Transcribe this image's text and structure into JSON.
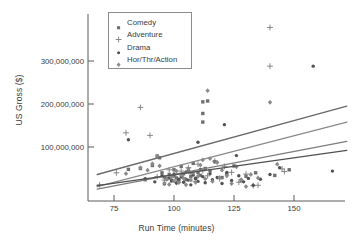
{
  "chart_data": {
    "type": "scatter",
    "title": "",
    "xlabel": "Run Time (minutes)",
    "ylabel": "US Gross ($)",
    "xlim": [
      67,
      175
    ],
    "ylim": [
      -12000000,
      395000000
    ],
    "xticks": [
      75,
      100,
      125,
      150
    ],
    "xtick_labels": [
      "75",
      "100",
      "125",
      "150"
    ],
    "yticks": [
      100000000,
      200000000,
      300000000
    ],
    "ytick_labels": [
      "100,000,000",
      "200,000,000",
      "300,000,000"
    ],
    "grid": false,
    "legend_position": "top-left-inside",
    "series": [
      {
        "name": "Comedy",
        "marker": "square",
        "color": "#6f6f6f",
        "points": [
          [
            81,
            48000000
          ],
          [
            86,
            50000000
          ],
          [
            88,
            24000000
          ],
          [
            91,
            57000000
          ],
          [
            93,
            79000000
          ],
          [
            94,
            75000000
          ],
          [
            95,
            40000000
          ],
          [
            96,
            30000000
          ],
          [
            97,
            26000000
          ],
          [
            98,
            36000000
          ],
          [
            99,
            22000000
          ],
          [
            100,
            33000000
          ],
          [
            100,
            47000000
          ],
          [
            101,
            28000000
          ],
          [
            102,
            20000000
          ],
          [
            103,
            55000000
          ],
          [
            104,
            38000000
          ],
          [
            105,
            24000000
          ],
          [
            106,
            44000000
          ],
          [
            107,
            31000000
          ],
          [
            108,
            62000000
          ],
          [
            109,
            27000000
          ],
          [
            110,
            41000000
          ],
          [
            111,
            34000000
          ],
          [
            112,
            205000000
          ],
          [
            112,
            178000000
          ],
          [
            112,
            158000000
          ],
          [
            113,
            50000000
          ],
          [
            114,
            207000000
          ],
          [
            115,
            45000000
          ],
          [
            117,
            66000000
          ],
          [
            120,
            29000000
          ],
          [
            122,
            37000000
          ],
          [
            125,
            56000000
          ],
          [
            128,
            22000000
          ],
          [
            130,
            32000000
          ],
          [
            134,
            40000000
          ],
          [
            142,
            34000000
          ],
          [
            148,
            47000000
          ]
        ]
      },
      {
        "name": "Adventure",
        "marker": "plus",
        "color": "#7d7d7d",
        "points": [
          [
            69,
            12000000
          ],
          [
            76,
            40000000
          ],
          [
            80,
            133000000
          ],
          [
            86,
            192000000
          ],
          [
            90,
            127000000
          ],
          [
            93,
            31000000
          ],
          [
            96,
            23000000
          ],
          [
            98,
            47000000
          ],
          [
            100,
            35000000
          ],
          [
            101,
            18000000
          ],
          [
            103,
            44000000
          ],
          [
            104,
            29000000
          ],
          [
            106,
            52000000
          ],
          [
            107,
            38000000
          ],
          [
            109,
            20000000
          ],
          [
            110,
            60000000
          ],
          [
            112,
            45000000
          ],
          [
            114,
            33000000
          ],
          [
            117,
            67000000
          ],
          [
            119,
            26000000
          ],
          [
            121,
            55000000
          ],
          [
            124,
            41000000
          ],
          [
            127,
            18000000
          ],
          [
            130,
            37000000
          ],
          [
            133,
            10000000
          ],
          [
            135,
            11000000
          ],
          [
            140,
            378000000
          ],
          [
            140,
            288000000
          ],
          [
            145,
            49000000
          ],
          [
            146,
            43000000
          ]
        ]
      },
      {
        "name": "Drama",
        "marker": "dot",
        "color": "#515151",
        "points": [
          [
            81,
            117000000
          ],
          [
            88,
            26000000
          ],
          [
            92,
            19000000
          ],
          [
            95,
            33000000
          ],
          [
            96,
            14000000
          ],
          [
            98,
            28000000
          ],
          [
            99,
            21000000
          ],
          [
            100,
            37000000
          ],
          [
            101,
            16000000
          ],
          [
            102,
            25000000
          ],
          [
            103,
            30000000
          ],
          [
            104,
            18000000
          ],
          [
            105,
            42000000
          ],
          [
            106,
            23000000
          ],
          [
            107,
            12000000
          ],
          [
            108,
            35000000
          ],
          [
            109,
            27000000
          ],
          [
            110,
            111000000
          ],
          [
            110,
            20000000
          ],
          [
            111,
            48000000
          ],
          [
            112,
            31000000
          ],
          [
            113,
            17000000
          ],
          [
            115,
            38000000
          ],
          [
            116,
            24000000
          ],
          [
            118,
            29000000
          ],
          [
            120,
            15000000
          ],
          [
            121,
            152000000
          ],
          [
            122,
            41000000
          ],
          [
            124,
            22000000
          ],
          [
            126,
            80000000
          ],
          [
            127,
            33000000
          ],
          [
            129,
            19000000
          ],
          [
            131,
            27000000
          ],
          [
            133,
            11000000
          ],
          [
            136,
            25000000
          ],
          [
            140,
            36000000
          ],
          [
            144,
            52000000
          ],
          [
            158,
            288000000
          ],
          [
            166,
            44000000
          ]
        ]
      },
      {
        "name": "Hor/Thr/Action",
        "marker": "diamond",
        "color": "#8a8a8a",
        "points": [
          [
            80,
            38000000
          ],
          [
            86,
            52000000
          ],
          [
            89,
            46000000
          ],
          [
            91,
            61000000
          ],
          [
            93,
            79000000
          ],
          [
            94,
            56000000
          ],
          [
            96,
            16000000
          ],
          [
            97,
            25000000
          ],
          [
            98,
            13000000
          ],
          [
            99,
            30000000
          ],
          [
            100,
            21000000
          ],
          [
            101,
            44000000
          ],
          [
            102,
            17000000
          ],
          [
            103,
            35000000
          ],
          [
            104,
            27000000
          ],
          [
            105,
            12000000
          ],
          [
            106,
            50000000
          ],
          [
            107,
            23000000
          ],
          [
            108,
            40000000
          ],
          [
            109,
            18000000
          ],
          [
            110,
            32000000
          ],
          [
            111,
            58000000
          ],
          [
            112,
            70000000
          ],
          [
            113,
            26000000
          ],
          [
            114,
            231000000
          ],
          [
            115,
            73000000
          ],
          [
            116,
            20000000
          ],
          [
            118,
            64000000
          ],
          [
            119,
            29000000
          ],
          [
            120,
            46000000
          ],
          [
            122,
            33000000
          ],
          [
            124,
            15000000
          ],
          [
            126,
            54000000
          ],
          [
            128,
            24000000
          ],
          [
            130,
            8000000
          ],
          [
            132,
            36000000
          ],
          [
            135,
            28000000
          ],
          [
            140,
            204000000
          ],
          [
            143,
            60000000
          ]
        ]
      }
    ],
    "trendlines": [
      {
        "name": "Comedy",
        "color": "#6a6a6a",
        "x1": 68,
        "y1": 36000000,
        "x2": 172,
        "y2": 195000000
      },
      {
        "name": "Hor/Thr/Action",
        "color": "#8a8a8a",
        "x1": 68,
        "y1": 8000000,
        "x2": 172,
        "y2": 158000000
      },
      {
        "name": "Adventure",
        "color": "#7d7d7d",
        "x1": 68,
        "y1": 2000000,
        "x2": 172,
        "y2": 113000000
      },
      {
        "name": "Drama",
        "color": "#515151",
        "x1": 68,
        "y1": 10000000,
        "x2": 172,
        "y2": 92000000
      }
    ]
  },
  "legend": {
    "items": [
      {
        "label": "Comedy",
        "marker": "square-marker",
        "color": "#6f6f6f"
      },
      {
        "label": "Adventure",
        "marker": "plus-marker",
        "color": "#7d7d7d"
      },
      {
        "label": "Drama",
        "marker": "dot-marker",
        "color": "#515151"
      },
      {
        "label": "Hor/Thr/Action",
        "marker": "diamond-marker",
        "color": "#8a8a8a"
      }
    ]
  },
  "axes": {
    "x_title": "Run Time (minutes)",
    "y_title": "US Gross ($)",
    "x_tick_labels": [
      "75",
      "100",
      "125",
      "150"
    ],
    "y_tick_labels": [
      "100,000,000",
      "200,000,000",
      "300,000,000"
    ]
  }
}
